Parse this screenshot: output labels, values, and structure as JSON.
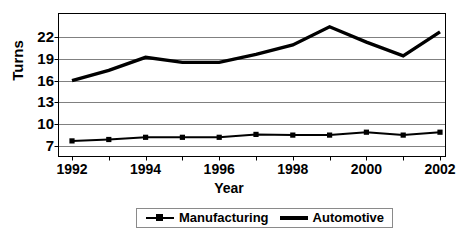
{
  "chart_data": {
    "type": "line",
    "title": "",
    "xlabel": "Year",
    "ylabel": "Turns",
    "x": [
      1992,
      1993,
      1994,
      1995,
      1996,
      1997,
      1998,
      1999,
      2000,
      2001,
      2002
    ],
    "xtick_labels": [
      "1992",
      "1993",
      "1994",
      "1995",
      "1996",
      "1997",
      "1998",
      "1999",
      "2000",
      "2001",
      "2002"
    ],
    "xtick_labels_shown": [
      "1992",
      "1994",
      "1996",
      "1998",
      "2000",
      "2002"
    ],
    "ytick_labels": [
      "7",
      "10",
      "13",
      "16",
      "19",
      "22"
    ],
    "yticks": [
      7,
      10,
      13,
      16,
      19,
      22
    ],
    "ylim": [
      6.0,
      26.0
    ],
    "xlim": [
      1991.6,
      2002.4
    ],
    "grid": "horizontal",
    "legend_position": "bottom-center",
    "series": [
      {
        "name": "Manufacturing",
        "marker": "square",
        "values": [
          7.7,
          7.9,
          8.2,
          8.2,
          8.2,
          8.6,
          8.5,
          8.5,
          8.9,
          8.5,
          8.9
        ],
        "color": "#000000"
      },
      {
        "name": "Automotive",
        "marker": "none",
        "values": [
          16.0,
          17.4,
          19.2,
          18.5,
          18.5,
          19.6,
          20.9,
          23.4,
          21.3,
          19.4,
          22.7
        ],
        "color": "#000000"
      }
    ]
  },
  "axis": {
    "y_title": "Turns",
    "x_title": "Year"
  },
  "legend": {
    "items": [
      {
        "label": "Manufacturing",
        "icon": "line-with-square-marker-icon"
      },
      {
        "label": "Automotive",
        "icon": "thick-line-icon"
      }
    ]
  },
  "colors": {
    "series_line": "#000000",
    "gridline": "#808080",
    "axis": "#000000",
    "background": "#ffffff",
    "legend_border": "#8a8a8a"
  }
}
